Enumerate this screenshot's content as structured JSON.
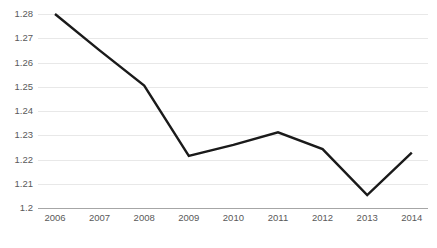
{
  "chart_data": {
    "type": "line",
    "title": "",
    "subtitle": "",
    "xlabel": "",
    "ylabel": "",
    "categories": [
      "2006",
      "2007",
      "2008",
      "2009",
      "2010",
      "2011",
      "2012",
      "2013",
      "2014"
    ],
    "series": [
      {
        "name": "series-1",
        "values": [
          1.28,
          1.265,
          1.2505,
          1.2215,
          1.226,
          1.2312,
          1.2243,
          1.2053,
          1.2228
        ]
      }
    ],
    "ylim": [
      1.2,
      1.28
    ],
    "xlim": [
      "2006",
      "2014"
    ],
    "y_ticks": [
      "1.28",
      "1.27",
      "1.26",
      "1.25",
      "1.24",
      "1.23",
      "1.22",
      "1.21",
      "1.2"
    ],
    "y_tick_values": [
      1.28,
      1.27,
      1.26,
      1.25,
      1.24,
      1.23,
      1.22,
      1.21,
      1.2
    ],
    "grid": true,
    "grid_axis": "y",
    "legend": false,
    "legend_position": "none",
    "markers": false,
    "colors": {
      "line": "#1a1a1a",
      "gridline": "#e8e8e8",
      "axis": "#a6a6a6",
      "tick_label": "#595959",
      "background": "#ffffff"
    }
  }
}
